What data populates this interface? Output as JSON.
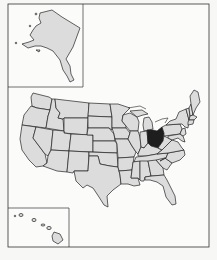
{
  "map": {
    "type": "US state locator map",
    "highlighted_state": "Ohio",
    "highlight_color": "#1e1e1e",
    "base_fill_color": "#dcdcdc",
    "border_color": "#222222",
    "background_color": "#fbfbfa",
    "insets": [
      "Alaska",
      "Hawaii"
    ]
  },
  "footer": {
    "text": ""
  }
}
